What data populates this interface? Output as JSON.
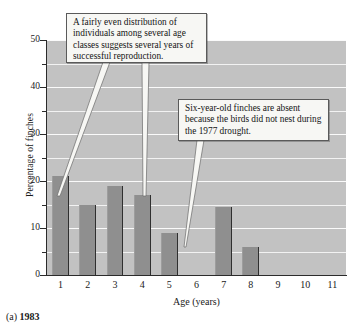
{
  "chart_data": {
    "type": "bar",
    "title": "",
    "xlabel": "Age (years)",
    "ylabel": "Percentage of finches",
    "categories": [
      "1",
      "2",
      "3",
      "4",
      "5",
      "6",
      "7",
      "8",
      "9",
      "10",
      "11"
    ],
    "values": [
      21,
      15,
      19,
      17,
      9,
      0,
      14.5,
      6,
      0,
      0,
      0
    ],
    "ylim": [
      0,
      50
    ],
    "ytick_labels": [
      "0",
      "10",
      "20",
      "30",
      "40",
      "50"
    ],
    "ytick_values": [
      0,
      10,
      20,
      30,
      40,
      50
    ],
    "yminor_values": [
      5,
      15,
      25,
      35,
      45
    ],
    "grid": "horizontal",
    "legend": "none",
    "plot_background": "#c2c2c2",
    "bar_color": "#8f8f8f",
    "gridline_color": "#f7f7f7",
    "annotations": [
      {
        "id": "callout-1",
        "text": "A fairly even distribution of individuals among several age classes suggests several years of successful reproduction.",
        "points_to": [
          "bar-1",
          "bar-4"
        ]
      },
      {
        "id": "callout-2",
        "text": "Six-year-old finches are absent because the birds did not nest during the 1977 drought.",
        "points_to": [
          "bar-6"
        ]
      }
    ]
  },
  "caption": {
    "prefix": "(a)",
    "year": "1983"
  }
}
